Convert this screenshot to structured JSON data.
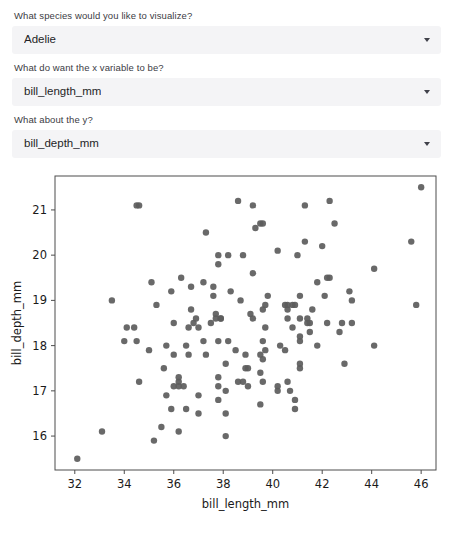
{
  "controls": [
    {
      "name": "species",
      "label": "What species would you like to visualize?",
      "value": "Adelie",
      "caret_icon": "chevron-down-icon"
    },
    {
      "name": "x-variable",
      "label": "What do want the x variable to be?",
      "value": "bill_length_mm",
      "caret_icon": "chevron-down-icon"
    },
    {
      "name": "y-variable",
      "label": "What about the y?",
      "value": "bill_depth_mm",
      "caret_icon": "chevron-down-icon"
    }
  ],
  "chart_data": {
    "type": "scatter",
    "title": "",
    "xlabel": "bill_length_mm",
    "ylabel": "bill_depth_mm",
    "xticks": [
      32,
      34,
      36,
      38,
      40,
      42,
      44,
      46
    ],
    "yticks": [
      16,
      17,
      18,
      19,
      20,
      21
    ],
    "xlim": [
      31.2,
      46.6
    ],
    "ylim": [
      15.25,
      21.75
    ],
    "grid": false,
    "legend": null,
    "marker_color": "#5c5c5c",
    "marker_size": 4.2,
    "series": [
      {
        "name": "Adelie",
        "points": [
          [
            32.1,
            15.5
          ],
          [
            33.1,
            16.1
          ],
          [
            33.5,
            19.0
          ],
          [
            34.0,
            18.1
          ],
          [
            34.1,
            18.4
          ],
          [
            34.4,
            18.4
          ],
          [
            34.5,
            18.1
          ],
          [
            34.5,
            21.1
          ],
          [
            34.6,
            17.2
          ],
          [
            34.6,
            21.1
          ],
          [
            35.0,
            17.9
          ],
          [
            35.1,
            19.4
          ],
          [
            35.2,
            15.9
          ],
          [
            35.3,
            18.9
          ],
          [
            35.5,
            16.2
          ],
          [
            35.6,
            17.5
          ],
          [
            35.7,
            16.9
          ],
          [
            35.7,
            18.0
          ],
          [
            35.9,
            16.6
          ],
          [
            35.9,
            19.2
          ],
          [
            36.0,
            17.1
          ],
          [
            36.0,
            17.8
          ],
          [
            36.0,
            18.5
          ],
          [
            36.2,
            16.1
          ],
          [
            36.2,
            17.2
          ],
          [
            36.2,
            17.3
          ],
          [
            36.2,
            17.1
          ],
          [
            36.3,
            19.5
          ],
          [
            36.4,
            17.1
          ],
          [
            36.5,
            16.6
          ],
          [
            36.5,
            18.0
          ],
          [
            36.6,
            17.8
          ],
          [
            36.6,
            18.4
          ],
          [
            36.7,
            18.8
          ],
          [
            36.7,
            19.3
          ],
          [
            36.8,
            18.5
          ],
          [
            36.9,
            18.6
          ],
          [
            37.0,
            16.5
          ],
          [
            37.0,
            16.9
          ],
          [
            37.0,
            18.4
          ],
          [
            37.2,
            18.1
          ],
          [
            37.2,
            19.4
          ],
          [
            37.3,
            17.8
          ],
          [
            37.3,
            20.5
          ],
          [
            37.5,
            18.5
          ],
          [
            37.6,
            19.1
          ],
          [
            37.6,
            19.3
          ],
          [
            37.7,
            18.7
          ],
          [
            37.7,
            18.6
          ],
          [
            37.8,
            16.8
          ],
          [
            37.8,
            17.1
          ],
          [
            37.8,
            17.3
          ],
          [
            37.8,
            18.1
          ],
          [
            37.8,
            19.8
          ],
          [
            37.8,
            20.0
          ],
          [
            37.9,
            18.6
          ],
          [
            37.9,
            18.6
          ],
          [
            38.1,
            16.5
          ],
          [
            38.1,
            16.0
          ],
          [
            38.1,
            17.0
          ],
          [
            38.1,
            17.6
          ],
          [
            38.2,
            18.1
          ],
          [
            38.2,
            20.0
          ],
          [
            38.3,
            19.2
          ],
          [
            38.5,
            17.9
          ],
          [
            38.6,
            17.2
          ],
          [
            38.6,
            21.2
          ],
          [
            38.7,
            19.0
          ],
          [
            38.8,
            17.2
          ],
          [
            38.8,
            20.0
          ],
          [
            38.9,
            17.8
          ],
          [
            38.9,
            17.5
          ],
          [
            39.0,
            17.1
          ],
          [
            39.0,
            17.5
          ],
          [
            39.1,
            18.7
          ],
          [
            39.2,
            18.6
          ],
          [
            39.2,
            19.6
          ],
          [
            39.2,
            21.1
          ],
          [
            39.3,
            20.6
          ],
          [
            39.5,
            16.7
          ],
          [
            39.5,
            17.4
          ],
          [
            39.5,
            17.8
          ],
          [
            39.5,
            20.7
          ],
          [
            39.6,
            17.2
          ],
          [
            39.6,
            17.7
          ],
          [
            39.6,
            18.1
          ],
          [
            39.6,
            18.8
          ],
          [
            39.6,
            20.7
          ],
          [
            39.7,
            17.9
          ],
          [
            39.7,
            18.4
          ],
          [
            39.7,
            18.9
          ],
          [
            39.8,
            19.1
          ],
          [
            40.2,
            17.1
          ],
          [
            40.2,
            20.1
          ],
          [
            40.2,
            17.0
          ],
          [
            40.3,
            18.0
          ],
          [
            40.5,
            17.9
          ],
          [
            40.5,
            18.9
          ],
          [
            40.6,
            17.2
          ],
          [
            40.6,
            18.6
          ],
          [
            40.6,
            18.8
          ],
          [
            40.6,
            18.9
          ],
          [
            40.7,
            17.0
          ],
          [
            40.8,
            18.4
          ],
          [
            40.8,
            18.9
          ],
          [
            40.9,
            16.8
          ],
          [
            40.9,
            18.9
          ],
          [
            40.9,
            16.6
          ],
          [
            41.0,
            20.0
          ],
          [
            41.1,
            17.5
          ],
          [
            41.1,
            17.6
          ],
          [
            41.1,
            18.2
          ],
          [
            41.1,
            18.6
          ],
          [
            41.1,
            19.1
          ],
          [
            41.1,
            18.1
          ],
          [
            41.3,
            21.1
          ],
          [
            41.3,
            20.3
          ],
          [
            41.4,
            18.5
          ],
          [
            41.4,
            18.6
          ],
          [
            41.5,
            18.3
          ],
          [
            41.5,
            18.5
          ],
          [
            41.6,
            18.8
          ],
          [
            41.8,
            19.4
          ],
          [
            41.8,
            18.0
          ],
          [
            42.0,
            20.2
          ],
          [
            42.1,
            19.1
          ],
          [
            42.2,
            18.5
          ],
          [
            42.2,
            19.5
          ],
          [
            42.3,
            21.2
          ],
          [
            42.3,
            19.5
          ],
          [
            42.5,
            20.7
          ],
          [
            42.7,
            18.3
          ],
          [
            42.8,
            18.5
          ],
          [
            42.9,
            17.6
          ],
          [
            43.1,
            19.2
          ],
          [
            43.2,
            19.0
          ],
          [
            43.2,
            18.5
          ],
          [
            44.1,
            18.0
          ],
          [
            44.1,
            19.7
          ],
          [
            45.8,
            18.9
          ],
          [
            45.6,
            20.3
          ],
          [
            46.0,
            21.5
          ]
        ]
      }
    ]
  }
}
